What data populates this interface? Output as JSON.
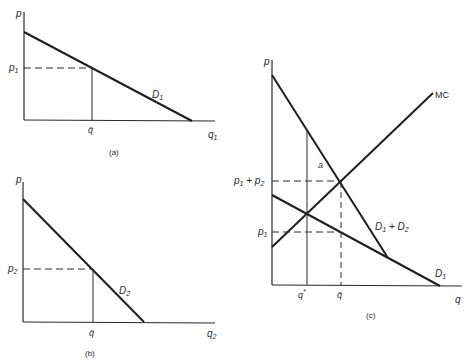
{
  "panels": {
    "a": {
      "caption": "(a)",
      "y_axis_label": "p",
      "x_axis_label": "q",
      "x_axis_sub": "1",
      "price_label": "p",
      "price_sub": "1",
      "qbar_label": "q̄",
      "curve_label": "D",
      "curve_sub": "1"
    },
    "b": {
      "caption": "(b)",
      "y_axis_label": "p",
      "x_axis_label": "q",
      "x_axis_sub": "2",
      "price_label": "p",
      "price_sub": "2",
      "qbar_label": "q̄",
      "curve_label": "D",
      "curve_sub": "2"
    },
    "c": {
      "caption": "(c)",
      "y_axis_label": "p",
      "x_axis_label": "q",
      "sum_price_p1": "p",
      "sum_price_sub1": "1",
      "sum_price_plus": " + p",
      "sum_price_sub2": "2",
      "price_label": "p",
      "price_sub": "1",
      "qstar_label": "q",
      "qstar_sup": "*",
      "qbar_label": "q̄",
      "area_label": "a",
      "mc_label": "MC",
      "sum_curve_D1": "D",
      "sum_curve_sub1": "1",
      "sum_curve_plus": " + D",
      "sum_curve_sub2": "2",
      "d1_label": "D",
      "d1_sub": "1"
    }
  },
  "colors": {
    "line": "#1e1e1e",
    "axis": "#2a2a2a",
    "text": "#2a2a2a"
  }
}
